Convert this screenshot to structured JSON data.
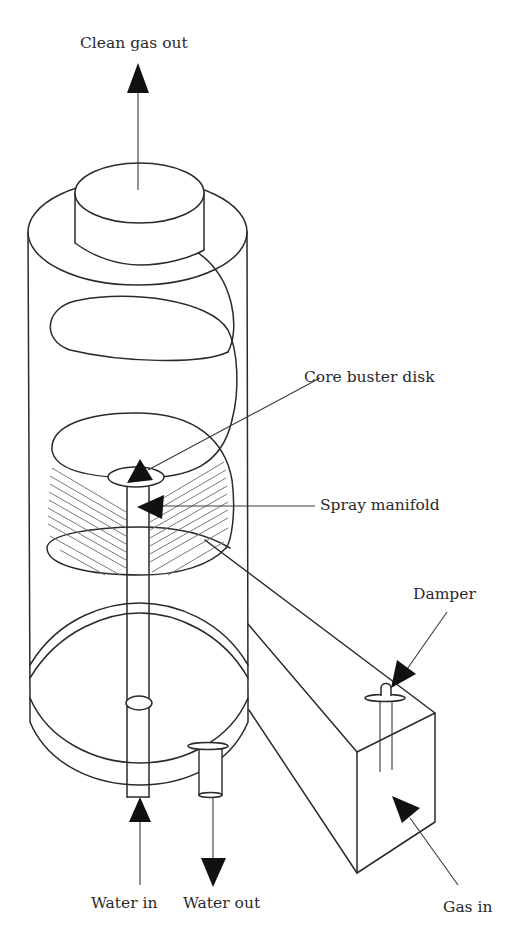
{
  "figure": {
    "labels": {
      "clean_gas_out": "Clean gas out",
      "core_buster_disk": "Core buster disk",
      "spray_manifold": "Spray manifold",
      "damper": "Damper",
      "water_in": "Water in",
      "water_out": "Water out",
      "gas_in": "Gas in"
    },
    "colors": {
      "line": "#2a2a2a",
      "arrowhead": "#111111",
      "hatch": "#6a6a6a",
      "background": "#ffffff"
    },
    "components": [
      "cylindrical-vessel",
      "outlet-cap",
      "spiral-gas-path",
      "core-buster-disk",
      "spray-manifold",
      "water-inlet-pipe",
      "water-outlet-pipe",
      "tangential-gas-inlet-duct",
      "damper"
    ]
  }
}
